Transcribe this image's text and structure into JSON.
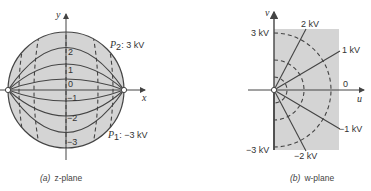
{
  "z_plane": {
    "x_axis_label": "x",
    "y_axis_label": "y",
    "potential_labels": [
      "2",
      "1",
      "0",
      "−1",
      "−2",
      "−3"
    ],
    "p2_label": "P",
    "p2_sub": "2",
    "p2_value": ": 3 kV",
    "p1_label": "P",
    "p1_sub": "1",
    "p1_value": ": −3 kV",
    "caption_tag": "(a)",
    "caption_text": "z-plane"
  },
  "w_plane": {
    "u_axis_label": "u",
    "v_axis_label": "v",
    "labels": {
      "top_left": "3 kV",
      "bottom_left": "−3 kV",
      "ray_2kv": "2 kV",
      "ray_1kv": "1 kV",
      "ray_0": "0",
      "ray_m1kv": "−1 kV",
      "ray_m2kv": "−2 kV"
    },
    "caption_tag": "(b)",
    "caption_text": "w-plane"
  },
  "colors": {
    "fill": "#d4d4d4",
    "line": "#444444"
  }
}
